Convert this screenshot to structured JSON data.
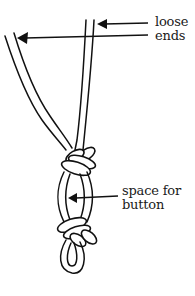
{
  "figure": {
    "type": "line-drawing",
    "stroke_color": "#111111",
    "background_color": "#ffffff"
  },
  "labels": {
    "loose_ends": {
      "line1": "loose",
      "line2": "ends"
    },
    "space_for_button": {
      "line1": "space for",
      "line2": "button"
    }
  },
  "callouts": [
    {
      "name": "loose-ends-arrow-upper",
      "target": "right strand pair",
      "label": "loose ends"
    },
    {
      "name": "loose-ends-arrow-lower",
      "target": "left strand pair",
      "label": "loose ends"
    },
    {
      "name": "space-for-button-arrow",
      "target": "loop between knots",
      "label": "space for button"
    }
  ]
}
